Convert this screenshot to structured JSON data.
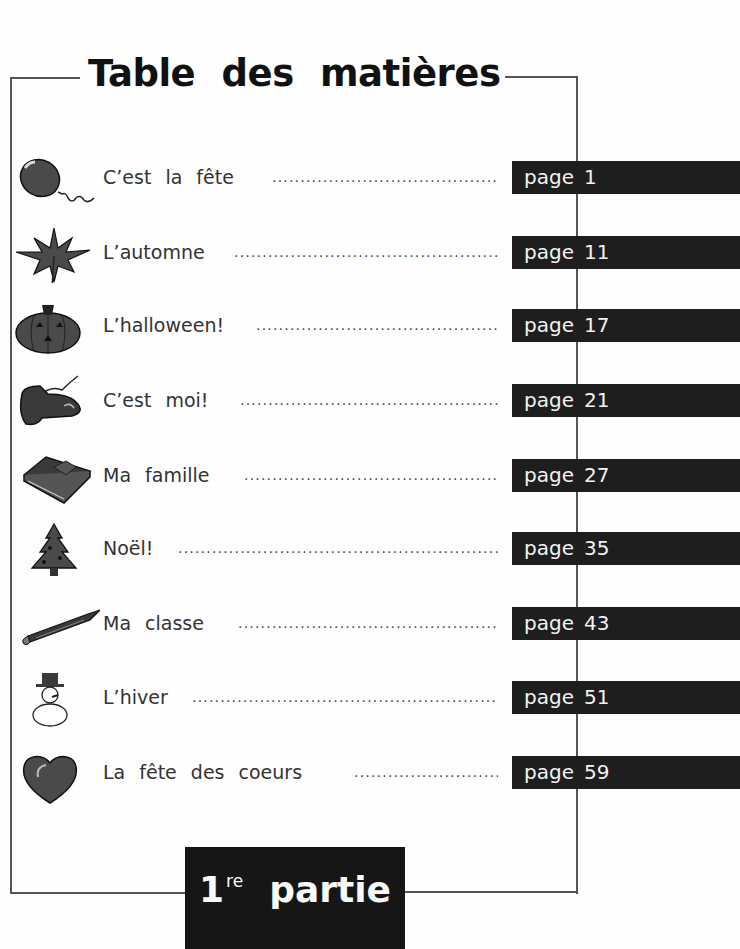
{
  "title": "Table des matières",
  "entries": [
    {
      "label": "C’est la fête",
      "page_word": "page",
      "page": "1",
      "icon": "balloon-icon"
    },
    {
      "label": "L’automne",
      "page_word": "page",
      "page": "11",
      "icon": "maple-leaf-icon"
    },
    {
      "label": "L’halloween!",
      "page_word": "page",
      "page": "17",
      "icon": "pumpkin-icon"
    },
    {
      "label": "C’est moi!",
      "page_word": "page",
      "page": "21",
      "icon": "shoe-icon"
    },
    {
      "label": "Ma famille",
      "page_word": "page",
      "page": "27",
      "icon": "book-icon"
    },
    {
      "label": "Noël!",
      "page_word": "page",
      "page": "35",
      "icon": "christmas-tree-icon"
    },
    {
      "label": "Ma classe",
      "page_word": "page",
      "page": "43",
      "icon": "pencil-icon"
    },
    {
      "label": "L’hiver",
      "page_word": "page",
      "page": "51",
      "icon": "snowman-icon"
    },
    {
      "label": "La fête des coeurs",
      "page_word": "page",
      "page": "59",
      "icon": "heart-icon"
    }
  ],
  "part": {
    "number": "1",
    "suffix": "re",
    "word": "partie"
  },
  "colors": {
    "bar": "#1e1e1e",
    "bar_text": "#f2f2f2",
    "frame": "#555555"
  }
}
